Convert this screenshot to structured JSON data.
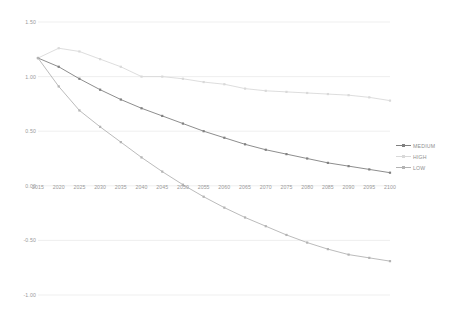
{
  "chart_data": {
    "type": "line",
    "title": "",
    "subtitle": "",
    "xlabel": "",
    "ylabel": "",
    "x": [
      2015,
      2020,
      2025,
      2030,
      2035,
      2040,
      2045,
      2050,
      2055,
      2060,
      2065,
      2070,
      2075,
      2080,
      2085,
      2090,
      2095,
      2100
    ],
    "categories": [
      "2015",
      "2020",
      "2025",
      "2030",
      "2035",
      "2040",
      "2045",
      "2050",
      "2055",
      "2060",
      "2065",
      "2070",
      "2075",
      "2080",
      "2085",
      "2090",
      "2095",
      "2100"
    ],
    "xlim": [
      2015,
      2100
    ],
    "ylim": [
      -1.0,
      1.5
    ],
    "yticks": [
      1.5,
      1.0,
      0.5,
      0.0,
      -0.5,
      -1.0
    ],
    "ytick_labels": [
      "1.50",
      "1.00",
      "0.50",
      "0.00",
      "-0.50",
      "-1.00"
    ],
    "grid": true,
    "grid_axis": "y",
    "legend_position": "right",
    "series": [
      {
        "name": "MEDIUM",
        "color": "#808080",
        "marker": "square",
        "values": [
          1.17,
          1.09,
          0.98,
          0.88,
          0.79,
          0.71,
          0.64,
          0.57,
          0.5,
          0.44,
          0.38,
          0.33,
          0.29,
          0.25,
          0.21,
          0.18,
          0.15,
          0.12
        ]
      },
      {
        "name": "HIGH",
        "color": "#d9d9d9",
        "marker": "square",
        "values": [
          1.17,
          1.26,
          1.23,
          1.16,
          1.09,
          1.0,
          1.0,
          0.98,
          0.95,
          0.93,
          0.89,
          0.87,
          0.86,
          0.85,
          0.84,
          0.83,
          0.81,
          0.78
        ]
      },
      {
        "name": "LOW",
        "color": "#b3b3b3",
        "marker": "square",
        "values": [
          1.17,
          0.91,
          0.69,
          0.54,
          0.4,
          0.26,
          0.13,
          0.01,
          -0.1,
          -0.2,
          -0.29,
          -0.37,
          -0.45,
          -0.52,
          -0.58,
          -0.63,
          -0.66,
          -0.69
        ]
      }
    ]
  },
  "legend": {
    "items": [
      {
        "label": "MEDIUM"
      },
      {
        "label": "HIGH"
      },
      {
        "label": "LOW"
      }
    ]
  },
  "colors": {
    "medium": "#808080",
    "high": "#d9d9d9",
    "low": "#b3b3b3",
    "grid": "#e8e8e8",
    "text": "#9a9a9a",
    "background": "#ffffff"
  }
}
